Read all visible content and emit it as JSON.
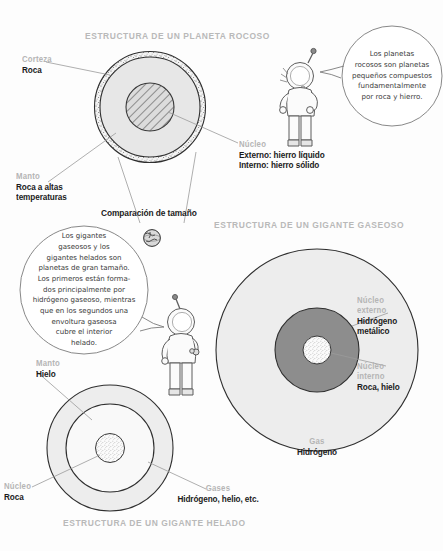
{
  "meta": {
    "width": 443,
    "height": 551,
    "background": "#fdfdfd",
    "ink": "#1b1b1b",
    "muted_label_color": "#b5b5b5",
    "title_color": "#b9b9b9"
  },
  "diagram": {
    "kind": "planet-interior-structure-infographic",
    "language": "es"
  },
  "sections": {
    "rocky": {
      "title": "ESTRUCTURA DE UN PLANETA ROCOSO",
      "labels": {
        "crust": {
          "key": "Corteza",
          "value": "Roca"
        },
        "mantle": {
          "key": "Manto",
          "value": "Roca a altas",
          "value2": "temperaturas"
        },
        "core": {
          "key": "Núcleo",
          "value": "Externo: hierro líquido",
          "value2": "Interno: hierro sólido"
        }
      },
      "size_comparison": "Comparación de tamaño",
      "colors": {
        "crust_fill": "#efefef",
        "mantle_fill": "#e6e6e6",
        "core_fill": "#d8d8d8",
        "stroke": "#3a3a3a"
      }
    },
    "gas_giant": {
      "title": "ESTRUCTURA DE UN GIGANTE GASEOSO",
      "labels": {
        "outer_core": {
          "key": "Núcleo",
          "key2": "externo",
          "value": "Hidrógeno",
          "value2": "metálico"
        },
        "inner_core": {
          "key": "Núcleo",
          "key2": "interno",
          "value": "Roca, hielo"
        },
        "gas": {
          "key": "Gas",
          "value": "Hidrógeno"
        }
      },
      "colors": {
        "gas_fill": "#ededed",
        "outer_core_fill": "#8d8d8d",
        "inner_core_fill": "#fbfbfb",
        "stroke": "#3a3a3a"
      }
    },
    "ice_giant": {
      "title": "ESTRUCTURA DE UN GIGANTE HELADO",
      "labels": {
        "mantle": {
          "key": "Manto",
          "value": "Hielo"
        },
        "core": {
          "key": "Núcleo",
          "value": "Roca"
        },
        "gases": {
          "key": "Gases",
          "value": "Hidrógeno, helio, etc."
        }
      },
      "colors": {
        "gases_fill": "#ededed",
        "mantle_fill": "#f8f8f8",
        "core_fill": "#e2e2e2",
        "stroke": "#3a3a3a"
      }
    }
  },
  "bubbles": {
    "rocky": {
      "lines": [
        "Los planetas",
        "rocosos son planetas",
        "pequeños compuestos",
        "fundamentalmente",
        "por roca y hierro."
      ]
    },
    "giants": {
      "lines": [
        "Los gigantes",
        "gaseosos y los",
        "gigantes helados son",
        "planetas de gran tamaño.",
        "Los primeros están forma-",
        "dos principalmente por",
        "hidrógeno gaseoso, mientras",
        "que en los segundos una",
        "envoltura gaseosa",
        "cubre el interior",
        "helado."
      ]
    }
  },
  "figures": {
    "astronaut_top": "astronaut-waving",
    "astronaut_middle": "astronaut-standing",
    "earth_globe": "earth-globe-icon"
  }
}
